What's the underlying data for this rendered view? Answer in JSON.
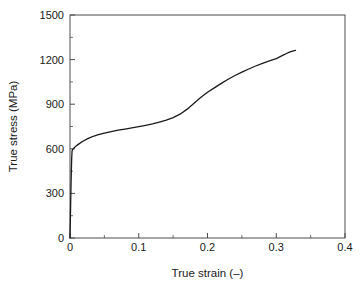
{
  "chart_data": {
    "type": "line",
    "title": "",
    "subtitle": "",
    "xlabel": "True strain (–)",
    "ylabel": "True stress (MPa)",
    "xlim": [
      0,
      0.4
    ],
    "ylim": [
      0,
      1500
    ],
    "xticks": [
      0,
      0.1,
      0.2,
      0.3,
      0.4
    ],
    "xticklabels": [
      "0",
      "0.1",
      "0.2",
      "0.3",
      "0.4"
    ],
    "yticks": [
      0,
      300,
      600,
      900,
      1200,
      1500
    ],
    "yticklabels": [
      "0",
      "300",
      "600",
      "900",
      "1200",
      "1500"
    ],
    "minor_xtick_interval": 0.05,
    "minor_ytick_interval": 150,
    "grid": false,
    "legend": false,
    "legend_position": "none",
    "line_color": "#1a1a1a",
    "line_width": 1.3,
    "series": [
      {
        "name": "True stress-strain curve",
        "x": [
          0.0,
          0.0005,
          0.001,
          0.0015,
          0.002,
          0.0025,
          0.003,
          0.0035,
          0.004,
          0.005,
          0.006,
          0.008,
          0.01,
          0.013,
          0.016,
          0.02,
          0.025,
          0.03,
          0.035,
          0.04,
          0.05,
          0.06,
          0.07,
          0.08,
          0.09,
          0.1,
          0.11,
          0.12,
          0.13,
          0.14,
          0.15,
          0.16,
          0.17,
          0.18,
          0.19,
          0.2,
          0.21,
          0.22,
          0.23,
          0.24,
          0.25,
          0.26,
          0.27,
          0.28,
          0.29,
          0.3,
          0.31,
          0.315,
          0.32,
          0.325,
          0.328
        ],
        "y": [
          0,
          120,
          240,
          360,
          460,
          540,
          585,
          592,
          596,
          601,
          606,
          615,
          623,
          633,
          643,
          654,
          667,
          677,
          686,
          693,
          706,
          716,
          725,
          733,
          741,
          749,
          758,
          768,
          780,
          793,
          810,
          833,
          865,
          905,
          945,
          980,
          1010,
          1040,
          1068,
          1093,
          1116,
          1137,
          1157,
          1175,
          1192,
          1207,
          1230,
          1241,
          1252,
          1259,
          1262
        ]
      }
    ]
  },
  "annotations": {
    "yield_stress_mpa": 600,
    "max_true_stress_mpa": 1262,
    "max_true_strain": 0.328
  }
}
